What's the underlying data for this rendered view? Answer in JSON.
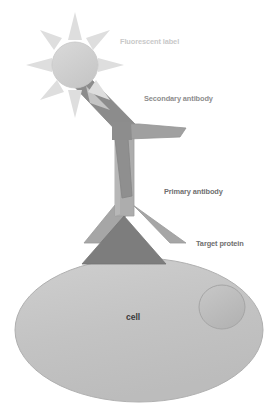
{
  "figure": {
    "background_color": "#ffffff"
  },
  "labels": {
    "fluorescent_label": "Fluorescent label",
    "secondary_antibody": "Secondary antibody",
    "primary_antibody": "Primary antibody",
    "target_protein": "Target protein",
    "cell": "cell"
  },
  "colors": {
    "fluorophore_fill": "#cfcfcf",
    "fluorophore_rays": "#dcdcdc",
    "secondary_antibody": "#8f8f8f",
    "secondary_antibody_shade": "#7d7d7d",
    "primary_antibody": "#a8a8a8",
    "primary_antibody_shade": "#9a9a9a",
    "target_protein": "#7b7b7b",
    "cell_fill": "#c4c4c4",
    "cell_stroke": "#b0b0b0",
    "nucleus_fill": "#b8b8b8",
    "nucleus_stroke": "#a6a6a6",
    "label_faint": "#c9c9c9",
    "label_mid": "#8d8d8d",
    "label_dark": "#6f6f6f",
    "label_cell": "#3b3b3b"
  },
  "elements": {
    "fluorophore": {
      "cx": 75,
      "cy": 65,
      "r": 22,
      "ray_count": 8
    },
    "secondary_antibody": {
      "description": "tilted Y-shaped antibody above primary antibody"
    },
    "primary_antibody": {
      "description": "inverted Y-shaped antibody binding target protein"
    },
    "target_protein": {
      "description": "dark triangle embedded in cell membrane"
    },
    "cell": {
      "cx": 139,
      "cy": 330,
      "rx": 124,
      "ry": 72
    },
    "nucleus": {
      "cx": 222,
      "cy": 307,
      "rx": 23,
      "ry": 22
    }
  }
}
